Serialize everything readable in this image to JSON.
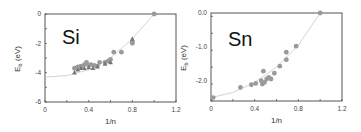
{
  "chart_data": [
    {
      "type": "scatter",
      "label": "Si",
      "xlabel": "1/n",
      "ylabel": "E_b (eV)",
      "xlim": [
        0,
        1.2
      ],
      "ylim": [
        -6,
        0
      ],
      "xticks": [
        "0",
        "0.4",
        "0.8",
        "1.2"
      ],
      "yticks": [
        "0",
        "-2",
        "-4",
        "-6"
      ],
      "grid": false,
      "series": [
        {
          "name": "circles",
          "marker": "circle",
          "points": [
            [
              0.27,
              -3.7
            ],
            [
              0.3,
              -3.6
            ],
            [
              0.33,
              -3.55
            ],
            [
              0.36,
              -3.45
            ],
            [
              0.38,
              -3.3
            ],
            [
              0.4,
              -3.5
            ],
            [
              0.42,
              -3.45
            ],
            [
              0.45,
              -3.5
            ],
            [
              0.48,
              -3.55
            ],
            [
              0.5,
              -3.3
            ],
            [
              0.55,
              -3.3
            ],
            [
              0.58,
              -3.2
            ],
            [
              0.6,
              -3.1
            ],
            [
              0.63,
              -2.6
            ],
            [
              0.7,
              -2.6
            ],
            [
              0.8,
              -1.9
            ],
            [
              0.8,
              -2.0
            ],
            [
              1.0,
              0.0
            ]
          ]
        },
        {
          "name": "triangles",
          "marker": "triangle",
          "points": [
            [
              0.27,
              -4.0
            ],
            [
              0.3,
              -3.8
            ],
            [
              0.33,
              -3.7
            ],
            [
              0.36,
              -3.7
            ],
            [
              0.4,
              -3.65
            ],
            [
              0.44,
              -3.7
            ],
            [
              0.48,
              -3.6
            ],
            [
              0.55,
              -3.4
            ],
            [
              0.6,
              -3.3
            ],
            [
              0.8,
              -1.7
            ]
          ]
        },
        {
          "name": "fit",
          "marker": "line",
          "points": [
            [
              0,
              -4.3
            ],
            [
              0.2,
              -4.2
            ],
            [
              0.4,
              -3.8
            ],
            [
              0.6,
              -3.0
            ],
            [
              0.8,
              -1.7
            ],
            [
              1.0,
              0.0
            ]
          ]
        }
      ]
    },
    {
      "type": "scatter",
      "label": "Sn",
      "xlabel": "1/n",
      "ylabel": "E_b (eV)",
      "xlim": [
        0,
        1.2
      ],
      "ylim": [
        -2.6,
        0
      ],
      "xticks": [
        "0",
        "0.4",
        "0.8",
        "1.2"
      ],
      "yticks": [
        "0.0",
        "-1.0",
        "-2.0"
      ],
      "grid": false,
      "series": [
        {
          "name": "circles",
          "marker": "circle",
          "points": [
            [
              0.02,
              -2.5
            ],
            [
              0.27,
              -2.2
            ],
            [
              0.37,
              -2.12
            ],
            [
              0.41,
              -2.08
            ],
            [
              0.46,
              -2.0
            ],
            [
              0.47,
              -2.1
            ],
            [
              0.48,
              -1.72
            ],
            [
              0.49,
              -2.05
            ],
            [
              0.51,
              -1.95
            ],
            [
              0.53,
              -1.9
            ],
            [
              0.55,
              -1.95
            ],
            [
              0.58,
              -1.78
            ],
            [
              0.63,
              -1.57
            ],
            [
              0.69,
              -1.38
            ],
            [
              0.69,
              -1.16
            ],
            [
              0.78,
              -0.98
            ],
            [
              1.0,
              0.0
            ]
          ]
        },
        {
          "name": "fit",
          "marker": "line",
          "points": [
            [
              0,
              -2.5
            ],
            [
              0.2,
              -2.35
            ],
            [
              0.4,
              -2.05
            ],
            [
              0.6,
              -1.6
            ],
            [
              0.8,
              -0.95
            ],
            [
              1.0,
              0.0
            ]
          ]
        }
      ]
    }
  ],
  "panels": {
    "si": {
      "title": "Si",
      "ylabel_main": "E",
      "ylabel_sub": "b",
      "ylabel_unit": " (eV)",
      "xlabel": "1/n"
    },
    "sn": {
      "title": "Sn",
      "ylabel_main": "E",
      "ylabel_sub": "b",
      "ylabel_unit": " (eV)",
      "xlabel": "1/n"
    }
  }
}
